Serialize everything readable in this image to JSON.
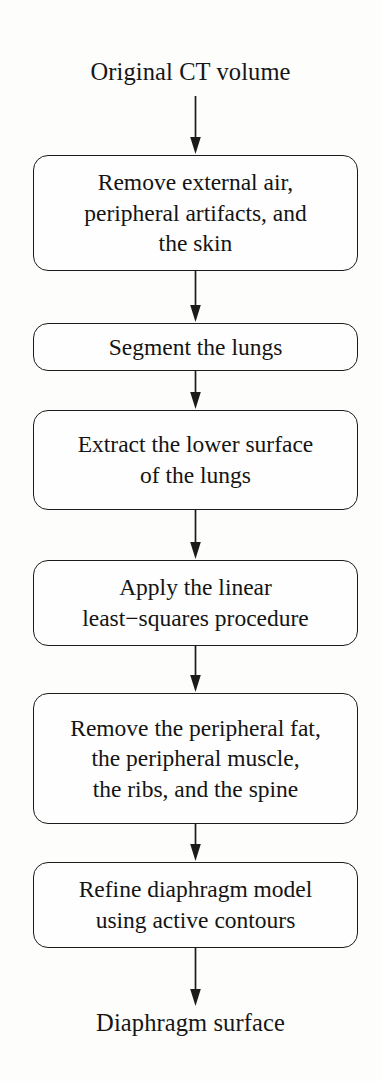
{
  "figure": {
    "type": "flowchart",
    "orientation": "vertical",
    "stroke_color": "#1b1b1b",
    "text_color": "#141414",
    "background_color": "#fdfdfc"
  },
  "terminals": {
    "start": "Original CT volume",
    "end": "Diaphragm surface"
  },
  "nodes": [
    {
      "id": "remove-external-air",
      "shape": "rounded-rect",
      "lines": [
        "Remove external air,",
        "peripheral artifacts, and",
        "the skin"
      ],
      "text": "Remove external air, peripheral artifacts, and the skin"
    },
    {
      "id": "segment-lungs",
      "shape": "rounded-rect",
      "lines": [
        "Segment the lungs"
      ],
      "text": "Segment the lungs"
    },
    {
      "id": "extract-lower-surface",
      "shape": "rounded-rect",
      "lines": [
        "Extract the lower surface",
        "of the lungs"
      ],
      "text": "Extract the lower surface of the lungs"
    },
    {
      "id": "linear-least-squares",
      "shape": "rounded-rect",
      "lines": [
        "Apply the linear",
        "least−squares procedure"
      ],
      "text": "Apply the linear least−squares procedure"
    },
    {
      "id": "remove-fat-muscle-ribs-spine",
      "shape": "rounded-rect",
      "lines": [
        "Remove the peripheral fat,",
        "the peripheral muscle,",
        "the ribs, and the spine"
      ],
      "text": "Remove the peripheral fat, the peripheral muscle, the ribs, and the spine"
    },
    {
      "id": "refine-active-contours",
      "shape": "rounded-rect",
      "lines": [
        "Refine diaphragm model",
        "using active contours"
      ],
      "text": "Refine diaphragm model using active contours"
    }
  ],
  "edges": [
    {
      "from": "start",
      "to": "remove-external-air",
      "style": "solid-arrow"
    },
    {
      "from": "remove-external-air",
      "to": "segment-lungs",
      "style": "solid-arrow"
    },
    {
      "from": "segment-lungs",
      "to": "extract-lower-surface",
      "style": "solid-arrow"
    },
    {
      "from": "extract-lower-surface",
      "to": "linear-least-squares",
      "style": "solid-arrow"
    },
    {
      "from": "linear-least-squares",
      "to": "remove-fat-muscle-ribs-spine",
      "style": "solid-arrow"
    },
    {
      "from": "remove-fat-muscle-ribs-spine",
      "to": "refine-active-contours",
      "style": "solid-arrow"
    },
    {
      "from": "refine-active-contours",
      "to": "end",
      "style": "solid-arrow"
    }
  ]
}
